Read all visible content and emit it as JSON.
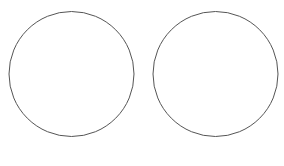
{
  "diagram": {
    "background": "#ffffff",
    "stroke_color": "#555555",
    "shapes": [
      {
        "type": "circle",
        "cx": 71.5,
        "cy": 74,
        "r": 62.5
      },
      {
        "type": "circle",
        "cx": 215.5,
        "cy": 74,
        "r": 62.5
      }
    ]
  }
}
